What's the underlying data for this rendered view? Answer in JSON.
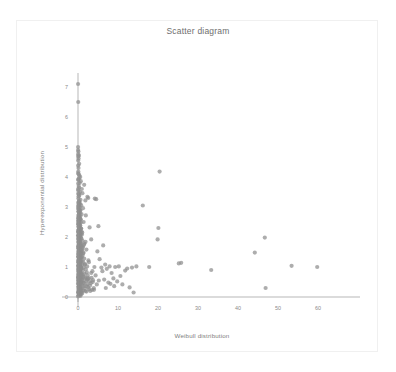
{
  "card": {
    "background": "#ffffff",
    "border_color": "#f0f0f0"
  },
  "chart_data": {
    "type": "scatter",
    "title": "Scatter diagram",
    "xlabel": "Weibull distribution",
    "ylabel": "Hyperexponential distribution",
    "xlim": [
      -1.5,
      63
    ],
    "ylim": [
      -0.25,
      7.6
    ],
    "xticks": [
      0,
      10,
      20,
      30,
      40,
      50,
      60
    ],
    "xticklabels": [
      "0",
      "10",
      "20",
      "30",
      "40",
      "50",
      "60"
    ],
    "yticks": [
      0,
      1,
      2,
      3,
      4,
      5,
      6,
      7
    ],
    "yticklabels": [
      "0",
      "1",
      "2",
      "3",
      "4",
      "5",
      "6",
      "7"
    ],
    "grid": false,
    "legend": null,
    "marker_color": "#8e8e8e",
    "marker_size": 2.1,
    "marker_opacity": 0.72,
    "axis_color": "#9a9a9a",
    "n_points": 420,
    "points": [
      [
        0.02,
        7.1
      ],
      [
        0.06,
        6.5
      ],
      [
        0.1,
        4.85
      ],
      [
        0.22,
        4.72
      ],
      [
        0.14,
        4.62
      ],
      [
        0.05,
        4.55
      ],
      [
        0.3,
        4.44
      ],
      [
        0.12,
        4.3
      ],
      [
        0.08,
        4.18
      ],
      [
        0.18,
        4.1
      ],
      [
        0.35,
        4.05
      ],
      [
        0.55,
        4.0
      ],
      [
        0.24,
        3.95
      ],
      [
        0.09,
        3.9
      ],
      [
        0.7,
        3.86
      ],
      [
        0.42,
        3.8
      ],
      [
        1.55,
        3.74
      ],
      [
        0.16,
        3.7
      ],
      [
        0.28,
        3.65
      ],
      [
        0.95,
        3.6
      ],
      [
        0.07,
        3.55
      ],
      [
        0.48,
        3.5
      ],
      [
        1.1,
        3.46
      ],
      [
        0.2,
        3.42
      ],
      [
        0.33,
        3.38
      ],
      [
        2.35,
        3.34
      ],
      [
        2.55,
        3.3
      ],
      [
        0.11,
        3.28
      ],
      [
        0.62,
        3.24
      ],
      [
        1.85,
        3.22
      ],
      [
        0.26,
        3.18
      ],
      [
        0.44,
        3.14
      ],
      [
        0.15,
        3.1
      ],
      [
        0.8,
        3.06
      ],
      [
        0.05,
        3.02
      ],
      [
        0.38,
        3.0
      ],
      [
        1.25,
        2.96
      ],
      [
        0.19,
        2.92
      ],
      [
        0.58,
        2.88
      ],
      [
        0.13,
        2.85
      ],
      [
        0.3,
        2.8
      ],
      [
        0.88,
        2.76
      ],
      [
        1.95,
        2.72
      ],
      [
        0.23,
        2.68
      ],
      [
        0.46,
        2.64
      ],
      [
        0.08,
        2.6
      ],
      [
        0.67,
        2.58
      ],
      [
        0.17,
        2.54
      ],
      [
        1.4,
        2.5
      ],
      [
        0.34,
        2.46
      ],
      [
        0.1,
        2.42
      ],
      [
        0.52,
        2.38
      ],
      [
        0.21,
        2.35
      ],
      [
        2.9,
        2.32
      ],
      [
        0.76,
        2.28
      ],
      [
        0.14,
        2.25
      ],
      [
        0.4,
        2.22
      ],
      [
        0.06,
        2.18
      ],
      [
        1.05,
        2.15
      ],
      [
        0.27,
        2.12
      ],
      [
        0.6,
        2.08
      ],
      [
        0.12,
        2.05
      ],
      [
        0.36,
        2.02
      ],
      [
        0.18,
        1.98
      ],
      [
        0.85,
        1.95
      ],
      [
        3.3,
        1.92
      ],
      [
        0.25,
        1.88
      ],
      [
        0.5,
        1.85
      ],
      [
        0.09,
        1.82
      ],
      [
        1.6,
        1.78
      ],
      [
        0.31,
        1.75
      ],
      [
        0.72,
        1.72
      ],
      [
        0.15,
        1.68
      ],
      [
        0.42,
        1.65
      ],
      [
        0.2,
        1.62
      ],
      [
        2.1,
        1.58
      ],
      [
        0.64,
        1.55
      ],
      [
        0.11,
        1.52
      ],
      [
        0.37,
        1.48
      ],
      [
        1.3,
        1.45
      ],
      [
        0.24,
        1.42
      ],
      [
        0.55,
        1.4
      ],
      [
        0.07,
        1.36
      ],
      [
        0.95,
        1.33
      ],
      [
        0.29,
        1.3
      ],
      [
        0.46,
        1.27
      ],
      [
        0.16,
        1.24
      ],
      [
        2.6,
        1.22
      ],
      [
        0.68,
        1.18
      ],
      [
        0.13,
        1.15
      ],
      [
        0.39,
        1.12
      ],
      [
        1.75,
        1.1
      ],
      [
        0.22,
        1.07
      ],
      [
        0.58,
        1.04
      ],
      [
        0.1,
        1.02
      ],
      [
        0.33,
        0.98
      ],
      [
        0.8,
        0.95
      ],
      [
        0.18,
        0.92
      ],
      [
        0.48,
        0.89
      ],
      [
        3.6,
        0.86
      ],
      [
        0.26,
        0.84
      ],
      [
        0.62,
        0.8
      ],
      [
        0.08,
        0.78
      ],
      [
        1.15,
        0.75
      ],
      [
        0.35,
        0.72
      ],
      [
        0.52,
        0.69
      ],
      [
        0.14,
        0.66
      ],
      [
        0.73,
        0.63
      ],
      [
        0.21,
        0.61
      ],
      [
        2.25,
        0.58
      ],
      [
        0.43,
        0.55
      ],
      [
        0.09,
        0.52
      ],
      [
        0.9,
        0.5
      ],
      [
        0.28,
        0.47
      ],
      [
        0.6,
        0.44
      ],
      [
        0.17,
        0.42
      ],
      [
        0.38,
        0.38
      ],
      [
        1.45,
        0.36
      ],
      [
        0.23,
        0.33
      ],
      [
        0.55,
        0.3
      ],
      [
        0.12,
        0.28
      ],
      [
        0.7,
        0.25
      ],
      [
        0.31,
        0.22
      ],
      [
        0.47,
        0.19
      ],
      [
        0.19,
        0.16
      ],
      [
        0.86,
        0.14
      ],
      [
        0.25,
        0.11
      ],
      [
        0.41,
        0.08
      ],
      [
        0.15,
        0.06
      ],
      [
        0.64,
        0.04
      ],
      [
        4.2,
        3.28
      ],
      [
        4.55,
        3.26
      ],
      [
        5.1,
        2.36
      ],
      [
        4.85,
        1.52
      ],
      [
        5.4,
        1.26
      ],
      [
        4.1,
        1.0
      ],
      [
        5.85,
        0.98
      ],
      [
        4.4,
        0.72
      ],
      [
        5.2,
        0.55
      ],
      [
        4.7,
        0.42
      ],
      [
        6.3,
        1.72
      ],
      [
        6.8,
        1.08
      ],
      [
        6.1,
        0.86
      ],
      [
        7.2,
        0.94
      ],
      [
        6.55,
        0.58
      ],
      [
        7.6,
        0.48
      ],
      [
        6.95,
        0.3
      ],
      [
        7.9,
        1.02
      ],
      [
        8.4,
        0.8
      ],
      [
        8.1,
        0.44
      ],
      [
        8.85,
        0.62
      ],
      [
        9.3,
        1.0
      ],
      [
        9.05,
        0.36
      ],
      [
        9.8,
        0.52
      ],
      [
        10.2,
        1.02
      ],
      [
        10.6,
        0.7
      ],
      [
        11.1,
        0.42
      ],
      [
        11.8,
        0.88
      ],
      [
        12.3,
        0.95
      ],
      [
        12.9,
        0.32
      ],
      [
        13.5,
        0.98
      ],
      [
        13.9,
        0.15
      ],
      [
        14.6,
        1.02
      ],
      [
        16.2,
        3.05
      ],
      [
        17.8,
        1.0
      ],
      [
        19.9,
        1.92
      ],
      [
        20.4,
        4.18
      ],
      [
        20.1,
        2.3
      ],
      [
        25.2,
        1.12
      ],
      [
        25.8,
        1.14
      ],
      [
        33.3,
        0.9
      ],
      [
        44.2,
        1.48
      ],
      [
        46.7,
        1.98
      ],
      [
        46.9,
        0.3
      ],
      [
        53.4,
        1.04
      ],
      [
        59.8,
        1.0
      ],
      [
        0.03,
        2.95
      ],
      [
        0.04,
        2.45
      ],
      [
        0.05,
        1.95
      ],
      [
        0.03,
        1.45
      ],
      [
        0.04,
        0.95
      ],
      [
        0.02,
        0.45
      ],
      [
        0.06,
        3.45
      ],
      [
        0.07,
        2.2
      ],
      [
        0.04,
        1.7
      ],
      [
        0.05,
        1.2
      ],
      [
        0.03,
        0.7
      ],
      [
        0.06,
        0.2
      ],
      [
        0.08,
        3.15
      ],
      [
        0.09,
        2.65
      ],
      [
        0.07,
        2.15
      ],
      [
        0.1,
        1.65
      ],
      [
        0.08,
        1.15
      ],
      [
        0.09,
        0.65
      ],
      [
        0.11,
        0.15
      ],
      [
        0.12,
        3.35
      ],
      [
        0.13,
        2.85
      ],
      [
        0.11,
        2.35
      ],
      [
        0.14,
        1.85
      ],
      [
        0.12,
        1.35
      ],
      [
        0.13,
        0.85
      ],
      [
        0.15,
        0.35
      ],
      [
        0.16,
        3.05
      ],
      [
        0.17,
        2.55
      ],
      [
        0.15,
        2.05
      ],
      [
        0.18,
        1.55
      ],
      [
        0.16,
        1.05
      ],
      [
        0.17,
        0.55
      ],
      [
        0.19,
        0.05
      ],
      [
        0.2,
        2.75
      ],
      [
        0.21,
        2.25
      ],
      [
        0.19,
        1.75
      ],
      [
        0.22,
        1.25
      ],
      [
        0.2,
        0.75
      ],
      [
        0.21,
        0.25
      ],
      [
        0.23,
        3.2
      ],
      [
        0.24,
        2.7
      ],
      [
        0.22,
        2.2
      ],
      [
        0.25,
        1.7
      ],
      [
        0.23,
        1.2
      ],
      [
        0.24,
        0.7
      ],
      [
        0.26,
        0.2
      ],
      [
        0.27,
        2.9
      ],
      [
        0.28,
        2.4
      ],
      [
        0.26,
        1.9
      ],
      [
        0.29,
        1.4
      ],
      [
        0.27,
        0.9
      ],
      [
        0.28,
        0.4
      ],
      [
        0.3,
        3.1
      ],
      [
        0.31,
        2.6
      ],
      [
        0.32,
        2.1
      ],
      [
        0.3,
        1.6
      ],
      [
        0.33,
        1.1
      ],
      [
        0.31,
        0.6
      ],
      [
        0.32,
        0.1
      ],
      [
        0.34,
        2.8
      ],
      [
        0.35,
        2.3
      ],
      [
        0.36,
        1.8
      ],
      [
        0.34,
        1.3
      ],
      [
        0.37,
        0.8
      ],
      [
        0.35,
        0.3
      ],
      [
        0.38,
        2.98
      ],
      [
        0.39,
        2.48
      ],
      [
        0.4,
        1.98
      ],
      [
        0.38,
        1.48
      ],
      [
        0.41,
        0.98
      ],
      [
        0.39,
        0.48
      ],
      [
        0.42,
        3.08
      ],
      [
        0.43,
        2.58
      ],
      [
        0.44,
        2.08
      ],
      [
        0.42,
        1.58
      ],
      [
        0.45,
        1.08
      ],
      [
        0.43,
        0.58
      ],
      [
        0.46,
        0.08
      ],
      [
        0.48,
        2.78
      ],
      [
        0.49,
        2.28
      ],
      [
        0.5,
        1.78
      ],
      [
        0.47,
        1.28
      ],
      [
        0.51,
        0.78
      ],
      [
        0.49,
        0.28
      ],
      [
        0.53,
        2.88
      ],
      [
        0.54,
        2.38
      ],
      [
        0.55,
        1.88
      ],
      [
        0.52,
        1.38
      ],
      [
        0.56,
        0.88
      ],
      [
        0.54,
        0.38
      ],
      [
        0.58,
        2.68
      ],
      [
        0.59,
        2.18
      ],
      [
        0.6,
        1.68
      ],
      [
        0.57,
        1.18
      ],
      [
        0.61,
        0.68
      ],
      [
        0.59,
        0.18
      ],
      [
        0.64,
        2.58
      ],
      [
        0.65,
        2.08
      ],
      [
        0.66,
        1.58
      ],
      [
        0.63,
        1.08
      ],
      [
        0.67,
        0.58
      ],
      [
        0.65,
        0.08
      ],
      [
        0.7,
        2.48
      ],
      [
        0.72,
        1.98
      ],
      [
        0.74,
        1.48
      ],
      [
        0.71,
        0.98
      ],
      [
        0.75,
        0.48
      ],
      [
        0.78,
        2.28
      ],
      [
        0.8,
        1.78
      ],
      [
        0.82,
        1.28
      ],
      [
        0.79,
        0.78
      ],
      [
        0.83,
        0.28
      ],
      [
        0.88,
        2.18
      ],
      [
        0.9,
        1.68
      ],
      [
        0.92,
        1.18
      ],
      [
        0.89,
        0.68
      ],
      [
        0.93,
        0.18
      ],
      [
        0.98,
        2.08
      ],
      [
        1.0,
        1.58
      ],
      [
        1.02,
        1.08
      ],
      [
        0.99,
        0.58
      ],
      [
        1.03,
        0.12
      ],
      [
        1.1,
        1.88
      ],
      [
        1.13,
        1.38
      ],
      [
        1.16,
        0.88
      ],
      [
        1.12,
        0.38
      ],
      [
        1.22,
        1.68
      ],
      [
        1.26,
        1.18
      ],
      [
        1.3,
        0.68
      ],
      [
        1.27,
        0.22
      ],
      [
        1.38,
        1.48
      ],
      [
        1.42,
        0.98
      ],
      [
        1.46,
        0.48
      ],
      [
        1.55,
        1.28
      ],
      [
        1.6,
        0.78
      ],
      [
        1.65,
        0.28
      ],
      [
        1.72,
        1.08
      ],
      [
        1.78,
        0.62
      ],
      [
        1.85,
        0.2
      ],
      [
        1.95,
        0.92
      ],
      [
        2.02,
        0.52
      ],
      [
        2.1,
        0.18
      ],
      [
        2.2,
        0.82
      ],
      [
        2.3,
        0.42
      ],
      [
        2.42,
        0.72
      ],
      [
        2.52,
        0.32
      ],
      [
        2.65,
        0.62
      ],
      [
        2.78,
        0.26
      ],
      [
        2.9,
        0.52
      ],
      [
        3.05,
        0.2
      ],
      [
        3.2,
        0.46
      ],
      [
        3.4,
        0.64
      ],
      [
        3.55,
        0.24
      ],
      [
        3.75,
        0.56
      ],
      [
        3.95,
        0.3
      ],
      [
        0.02,
        3.6
      ],
      [
        0.03,
        4.12
      ],
      [
        0.05,
        3.78
      ],
      [
        0.04,
        4.38
      ],
      [
        0.06,
        3.92
      ],
      [
        0.02,
        2.05
      ],
      [
        0.03,
        1.05
      ],
      [
        0.04,
        0.58
      ],
      [
        0.05,
        0.14
      ],
      [
        0.02,
        0.02
      ],
      [
        0.07,
        0.88
      ],
      [
        0.08,
        1.62
      ],
      [
        0.06,
        2.52
      ],
      [
        0.09,
        0.34
      ],
      [
        0.1,
        1.32
      ],
      [
        0.11,
        2.72
      ],
      [
        0.12,
        0.64
      ],
      [
        0.13,
        1.92
      ],
      [
        0.14,
        0.44
      ],
      [
        0.15,
        2.62
      ],
      [
        0.16,
        1.42
      ],
      [
        0.17,
        0.74
      ],
      [
        0.18,
        2.42
      ],
      [
        0.19,
        1.22
      ],
      [
        0.2,
        0.54
      ],
      [
        0.21,
        2.32
      ],
      [
        0.22,
        1.52
      ],
      [
        0.23,
        0.84
      ],
      [
        0.24,
        2.12
      ],
      [
        0.25,
        1.62
      ],
      [
        0.26,
        0.94
      ],
      [
        0.27,
        2.02
      ],
      [
        0.28,
        1.72
      ],
      [
        0.29,
        0.24
      ],
      [
        0.3,
        1.82
      ],
      [
        0.32,
        0.36
      ],
      [
        0.34,
        1.02
      ],
      [
        0.36,
        0.46
      ],
      [
        0.4,
        1.12
      ],
      [
        0.44,
        0.66
      ],
      [
        0.5,
        1.24
      ],
      [
        0.56,
        0.86
      ],
      [
        0.62,
        1.34
      ],
      [
        0.68,
        0.76
      ],
      [
        0.76,
        1.44
      ],
      [
        0.84,
        0.96
      ],
      [
        0.94,
        1.54
      ],
      [
        1.06,
        0.56
      ],
      [
        1.18,
        1.64
      ],
      [
        1.34,
        0.46
      ],
      [
        1.5,
        1.74
      ],
      [
        1.68,
        0.66
      ],
      [
        1.88,
        1.84
      ],
      [
        2.08,
        0.36
      ],
      [
        2.28,
        1.02
      ],
      [
        2.48,
        0.62
      ],
      [
        2.72,
        1.16
      ],
      [
        3.0,
        0.38
      ],
      [
        3.3,
        0.8
      ],
      [
        3.7,
        0.5
      ],
      [
        4.0,
        0.24
      ],
      [
        0.015,
        5.0
      ],
      [
        0.025,
        4.9
      ],
      [
        0.035,
        4.76
      ],
      [
        0.045,
        4.68
      ]
    ]
  }
}
